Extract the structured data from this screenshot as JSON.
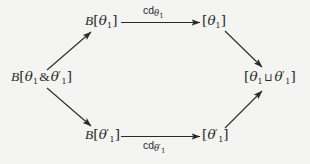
{
  "diagram": {
    "type": "commutative-diagram",
    "background_color": "#f4f4f2",
    "ink_color": "#2b2b2b",
    "nodes": [
      {
        "id": "top-left",
        "label": "B[θ₁]",
        "x": 101,
        "y": 22
      },
      {
        "id": "top-right",
        "label": "[θ₁]",
        "x": 211,
        "y": 22
      },
      {
        "id": "left",
        "label": "B[θ₁ & θ′₁]",
        "x": 47,
        "y": 78
      },
      {
        "id": "right",
        "label": "[θ₁ ⊔ θ′₁]",
        "x": 271,
        "y": 78
      },
      {
        "id": "bottom-left",
        "label": "B[θ′₁]",
        "x": 101,
        "y": 136
      },
      {
        "id": "bottom-right",
        "label": "[θ′₁]",
        "x": 211,
        "y": 136
      }
    ],
    "edges": [
      {
        "id": "top-horizontal",
        "from": "top-left",
        "to": "top-right",
        "label": "cdθ₁",
        "label_position": "above"
      },
      {
        "id": "bottom-horizontal",
        "from": "bottom-left",
        "to": "bottom-right",
        "label": "cdθ′₁",
        "label_position": "below"
      },
      {
        "id": "left-to-top-left",
        "from": "left",
        "to": "top-left",
        "label": "",
        "label_position": "none"
      },
      {
        "id": "left-to-bottom-left",
        "from": "left",
        "to": "bottom-left",
        "label": "",
        "label_position": "none"
      },
      {
        "id": "top-right-to-right",
        "from": "top-right",
        "to": "right",
        "label": "",
        "label_position": "none"
      },
      {
        "id": "bottom-right-to-right",
        "from": "bottom-right",
        "to": "right",
        "label": "",
        "label_position": "none"
      }
    ],
    "labels": {
      "fn_symbol": "B",
      "bracket_open": "[",
      "bracket_close": "]",
      "theta": "θ",
      "subscript_one": "1",
      "prime": "′",
      "and_symbol": "&",
      "join_symbol": "⊔",
      "cd_symbol": "cd"
    }
  }
}
